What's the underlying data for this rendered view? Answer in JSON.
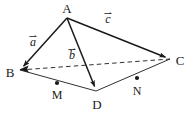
{
  "figure": {
    "type": "geometry-vector-diagram",
    "width": 194,
    "height": 115,
    "background_color": "#ffffff",
    "stroke_color": "#1a1a1a"
  },
  "vertices": [
    {
      "id": "A",
      "label": "A",
      "x": 67,
      "y": 18,
      "label_x": 67,
      "label_y": 8,
      "marker": false
    },
    {
      "id": "B",
      "label": "B",
      "x": 20,
      "y": 70,
      "label_x": 10,
      "label_y": 72,
      "marker": false
    },
    {
      "id": "C",
      "label": "C",
      "x": 170,
      "y": 59,
      "label_x": 180,
      "label_y": 60,
      "marker": false
    },
    {
      "id": "D",
      "label": "D",
      "x": 96,
      "y": 91,
      "label_x": 97,
      "label_y": 104,
      "marker": false
    }
  ],
  "points": [
    {
      "id": "M",
      "label": "M",
      "x": 57,
      "y": 83,
      "label_x": 57,
      "label_y": 95,
      "marker": true,
      "on_segment": "B-D"
    },
    {
      "id": "N",
      "label": "N",
      "x": 137,
      "y": 78,
      "label_x": 137,
      "label_y": 91,
      "marker": true,
      "on_segment": "D-C"
    }
  ],
  "vectors": [
    {
      "id": "a",
      "label": "a",
      "from": "A",
      "to": "B",
      "x1": 67,
      "y1": 18,
      "x2": 20,
      "y2": 70,
      "label_x": 33,
      "label_y": 40,
      "style": "solid",
      "arrow": true
    },
    {
      "id": "b",
      "label": "b",
      "from": "A",
      "to": "D",
      "x1": 67,
      "y1": 18,
      "x2": 96,
      "y2": 91,
      "label_x": 72,
      "label_y": 53,
      "style": "solid",
      "arrow": true
    },
    {
      "id": "c",
      "label": "c",
      "from": "A",
      "to": "C",
      "x1": 67,
      "y1": 18,
      "x2": 170,
      "y2": 59,
      "label_x": 108,
      "label_y": 17,
      "style": "solid",
      "arrow": true
    }
  ],
  "edges": [
    {
      "id": "BD",
      "from": "B",
      "to": "D",
      "x1": 20,
      "y1": 70,
      "x2": 96,
      "y2": 91,
      "style": "solid",
      "arrow": false
    },
    {
      "id": "DC",
      "from": "D",
      "to": "C",
      "x1": 96,
      "y1": 91,
      "x2": 170,
      "y2": 59,
      "style": "solid",
      "arrow": false
    },
    {
      "id": "BC",
      "from": "B",
      "to": "C",
      "x1": 20,
      "y1": 70,
      "x2": 170,
      "y2": 59,
      "style": "dashed",
      "arrow": false
    }
  ],
  "arrow_glyph": "⇀"
}
